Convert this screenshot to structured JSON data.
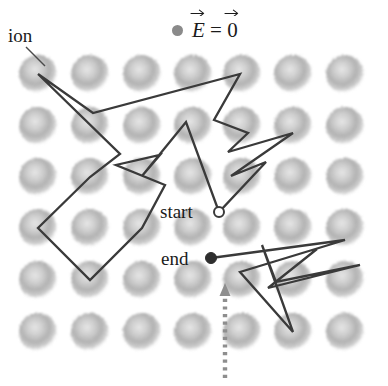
{
  "figure": {
    "width": 388,
    "height": 386,
    "background": "#ffffff"
  },
  "labels": {
    "ion": "ion",
    "start": "start",
    "end": "end"
  },
  "legend": {
    "marker": "gray-dot",
    "marker_color": "#8a8a8a",
    "symbol_field": "E",
    "equals": "=",
    "symbol_value": "0",
    "full_text": "E = 0",
    "description": "field vector equals zero vector"
  },
  "colors": {
    "ion_fill": "#a8a8a8",
    "ion_core": "#cccccc",
    "path_stroke": "#3a3a3a",
    "leader_stroke": "#4a4a4a",
    "arrow_stroke": "#8e8e8e",
    "text": "#1b1b1b"
  },
  "lattice": {
    "rows": 6,
    "cols": 7,
    "x_positions": [
      38,
      90,
      142,
      193,
      242,
      293,
      345
    ],
    "y_positions": [
      74,
      126,
      177,
      228,
      280,
      332
    ],
    "ion_radius": 19
  },
  "markers": {
    "start": {
      "x": 219,
      "y": 212,
      "style": "open-circle",
      "radius": 5
    },
    "end": {
      "x": 211,
      "y": 258,
      "style": "filled-circle",
      "radius": 5.5
    }
  },
  "ion_leader": {
    "x1": 26,
    "y1": 47,
    "x2": 45,
    "y2": 66
  },
  "field_arrow": {
    "style": "dotted",
    "x": 225,
    "y_tail": 378,
    "y_head": 283,
    "direction": "up",
    "color": "#8e8e8e"
  },
  "walk_path": {
    "description": "electron scattering trajectory through the ion lattice",
    "points": [
      [
        38,
        74
      ],
      [
        93,
        113
      ],
      [
        240,
        74
      ],
      [
        214,
        120
      ],
      [
        248,
        133
      ],
      [
        228,
        152
      ],
      [
        293,
        133
      ],
      [
        231,
        176
      ],
      [
        266,
        162
      ],
      [
        219,
        212
      ],
      [
        186,
        122
      ],
      [
        142,
        176
      ],
      [
        160,
        155
      ],
      [
        116,
        165
      ],
      [
        165,
        185
      ],
      [
        142,
        228
      ],
      [
        90,
        280
      ],
      [
        38,
        228
      ],
      [
        90,
        177
      ],
      [
        120,
        154
      ],
      [
        38,
        74
      ]
    ],
    "second_segment_points": [
      [
        211,
        258
      ],
      [
        345,
        240
      ],
      [
        240,
        272
      ],
      [
        293,
        332
      ],
      [
        262,
        245
      ],
      [
        276,
        282
      ],
      [
        360,
        265
      ],
      [
        268,
        288
      ],
      [
        317,
        249
      ]
    ]
  }
}
